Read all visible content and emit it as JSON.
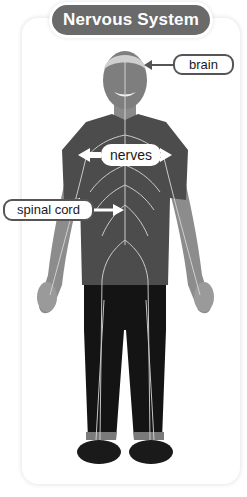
{
  "title": "Nervous System",
  "labels": {
    "brain": "brain",
    "nerves": "nerves",
    "spinal_cord": "spinal cord"
  },
  "figure": {
    "icon": "human-figure-icon"
  },
  "colors": {
    "title_bg": "#6a6a6a",
    "title_text": "#ffffff",
    "label_border": "#555555",
    "nerve_lines": "#d8d8d8",
    "shirt": "#4a4a4a",
    "pants": "#151515",
    "skin": "#9a9a9a"
  }
}
